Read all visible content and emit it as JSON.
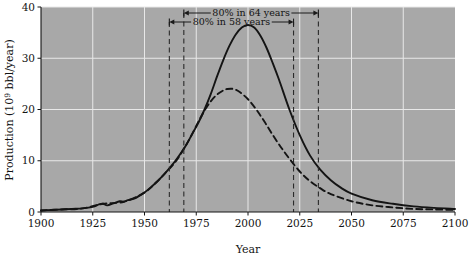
{
  "chart_data": {
    "type": "line",
    "title": "",
    "xlabel": "Year",
    "ylabel": "Production (10⁹ bbl/year)",
    "ylabel_main": "Production (10",
    "ylabel_exp": "9",
    "ylabel_tail": " bbl/year)",
    "xlim": [
      1900,
      2100
    ],
    "ylim": [
      0,
      40
    ],
    "grid": true,
    "legend": "none",
    "plot_bgcolor": "#a8a8a8",
    "line_color": "#141414",
    "gridline_color": "#e8e8e8",
    "xticks": [
      1900,
      1925,
      1950,
      1975,
      2000,
      2025,
      2050,
      2075,
      2100
    ],
    "xtick_labels": [
      "1900",
      "1925",
      "1950",
      "1975",
      "2000",
      "2025",
      "2050",
      "2075",
      "2100"
    ],
    "yticks": [
      0,
      10,
      20,
      30,
      40
    ],
    "ytick_labels": [
      "0",
      "10",
      "20",
      "30",
      "40"
    ],
    "series": [
      {
        "name": "high-estimate-production",
        "style": "solid",
        "x": [
          1900,
          1905,
          1910,
          1915,
          1920,
          1925,
          1928,
          1930,
          1932,
          1935,
          1938,
          1940,
          1942,
          1945,
          1948,
          1950,
          1953,
          1956,
          1960,
          1963,
          1966,
          1970,
          1973,
          1976,
          1979,
          1982,
          1985,
          1988,
          1991,
          1994,
          1997,
          2000,
          2003,
          2006,
          2009,
          2012,
          2015,
          2020,
          2025,
          2030,
          2035,
          2040,
          2045,
          2050,
          2060,
          2070,
          2080,
          2090,
          2100
        ],
        "values": [
          0.3,
          0.4,
          0.5,
          0.6,
          0.7,
          1.0,
          1.5,
          1.6,
          1.3,
          1.7,
          2.1,
          2.0,
          2.3,
          2.6,
          3.3,
          3.8,
          4.8,
          5.9,
          7.6,
          9.0,
          10.6,
          13.0,
          15.2,
          17.4,
          20.0,
          23.0,
          26.4,
          29.6,
          32.4,
          34.6,
          36.0,
          36.5,
          36.0,
          34.4,
          32.0,
          29.0,
          25.8,
          20.0,
          15.0,
          11.0,
          8.2,
          6.2,
          4.7,
          3.6,
          2.3,
          1.6,
          1.1,
          0.8,
          0.6
        ]
      },
      {
        "name": "low-estimate-production",
        "style": "dashed",
        "x": [
          1900,
          1910,
          1920,
          1930,
          1940,
          1950,
          1956,
          1960,
          1965,
          1970,
          1973,
          1976,
          1979,
          1982,
          1985,
          1988,
          1990,
          1993,
          1996,
          2000,
          2004,
          2008,
          2012,
          2016,
          2020,
          2025,
          2030,
          2035,
          2040,
          2050,
          2060,
          2070,
          2080,
          2090,
          2100
        ],
        "values": [
          0.3,
          0.5,
          0.7,
          1.6,
          2.0,
          3.8,
          5.9,
          7.6,
          9.8,
          13.0,
          15.2,
          17.6,
          19.8,
          21.6,
          22.9,
          23.7,
          24.0,
          24.0,
          23.4,
          22.0,
          20.0,
          17.6,
          15.0,
          12.6,
          10.4,
          7.9,
          6.0,
          4.6,
          3.5,
          2.1,
          1.3,
          0.9,
          0.6,
          0.5,
          0.4
        ]
      }
    ],
    "annotations": [
      {
        "name": "span-64-years",
        "label": "80% in 64 years",
        "x_start": 1969,
        "x_end": 2034,
        "row": "upper"
      },
      {
        "name": "span-58-years",
        "label": "80% in 58 years",
        "x_start": 1962,
        "x_end": 2022,
        "row": "lower"
      }
    ],
    "vertical_markers": [
      {
        "name": "marker-1962",
        "x": 1962
      },
      {
        "name": "marker-1969",
        "x": 1969
      },
      {
        "name": "marker-2022",
        "x": 2022
      },
      {
        "name": "marker-2034",
        "x": 2034
      }
    ]
  }
}
